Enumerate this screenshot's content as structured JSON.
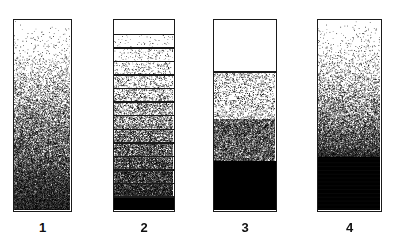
{
  "figure": {
    "title": "",
    "background_color": "#ffffff",
    "ink_color": "#000000",
    "border_color": "#1a1a1a",
    "width": 394,
    "height": 240
  },
  "columns": [
    {
      "id": "column-1",
      "label": "1",
      "style": "continuous-gradient",
      "x": 13,
      "y": 19,
      "width": 59,
      "height": 193,
      "description": "Continuous stipple gradient, white at top grading smoothly to solid black at base",
      "density_stops": [
        {
          "position": 0.0,
          "density": 0.0
        },
        {
          "position": 0.18,
          "density": 0.02
        },
        {
          "position": 0.3,
          "density": 0.09
        },
        {
          "position": 0.45,
          "density": 0.24
        },
        {
          "position": 0.58,
          "density": 0.4
        },
        {
          "position": 0.7,
          "density": 0.56
        },
        {
          "position": 0.8,
          "density": 0.7
        },
        {
          "position": 0.88,
          "density": 0.84
        },
        {
          "position": 0.94,
          "density": 0.95
        },
        {
          "position": 1.0,
          "density": 1.0
        }
      ]
    },
    {
      "id": "column-2",
      "label": "2",
      "style": "banded-gradient",
      "x": 113,
      "y": 19,
      "width": 62,
      "height": 193,
      "description": "Stepped gradient divided into horizontal bands by ruled lines, each band a uniform density increasing downward",
      "band_count": 14,
      "band_densities": [
        0.0,
        0.01,
        0.03,
        0.05,
        0.08,
        0.13,
        0.2,
        0.29,
        0.39,
        0.5,
        0.62,
        0.74,
        0.86,
        1.0
      ]
    },
    {
      "id": "column-3",
      "label": "3",
      "style": "discrete-zones",
      "x": 213,
      "y": 19,
      "width": 64,
      "height": 193,
      "description": "Four discrete zones separated by sharp boundaries: clear, light stipple, dense stipple, solid black",
      "zones": [
        {
          "name": "clear",
          "start": 0.0,
          "end": 0.27,
          "density": 0.0
        },
        {
          "name": "light-stipple",
          "start": 0.27,
          "end": 0.52,
          "density": 0.1
        },
        {
          "name": "dense-stipple",
          "start": 0.52,
          "end": 0.74,
          "density": 0.55
        },
        {
          "name": "solid-black",
          "start": 0.74,
          "end": 1.0,
          "density": 1.0
        }
      ]
    },
    {
      "id": "column-4",
      "label": "4",
      "style": "gradient-to-solid",
      "x": 317,
      "y": 19,
      "width": 65,
      "height": 193,
      "description": "Smooth stipple gradient from clear at top darkening downward, terminating in a solid black basal zone",
      "solid_black_start": 0.72,
      "density_stops": [
        {
          "position": 0.0,
          "density": 0.0
        },
        {
          "position": 0.15,
          "density": 0.02
        },
        {
          "position": 0.28,
          "density": 0.08
        },
        {
          "position": 0.4,
          "density": 0.2
        },
        {
          "position": 0.5,
          "density": 0.34
        },
        {
          "position": 0.58,
          "density": 0.48
        },
        {
          "position": 0.65,
          "density": 0.66
        },
        {
          "position": 0.7,
          "density": 0.86
        },
        {
          "position": 0.72,
          "density": 1.0
        },
        {
          "position": 1.0,
          "density": 1.0
        }
      ]
    }
  ],
  "labels": {
    "label_y": 216,
    "font_size": 13
  }
}
